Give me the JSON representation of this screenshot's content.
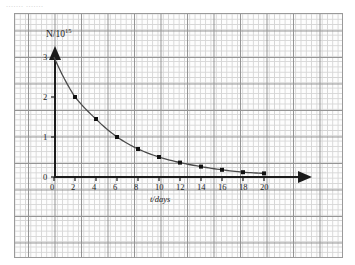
{
  "page": {
    "top_fragment": "....... ......."
  },
  "chart_data": {
    "type": "line",
    "title": "",
    "xlabel": "t/days",
    "ylabel": "N/10",
    "ylabel_exponent": "15",
    "xlim": [
      0,
      22
    ],
    "ylim": [
      0,
      3.2
    ],
    "xticks": [
      0,
      2,
      4,
      6,
      8,
      10,
      12,
      14,
      16,
      18,
      20
    ],
    "xtick_labels": [
      "0",
      "2",
      "4",
      "6",
      "8",
      "10",
      "12",
      "14",
      "16",
      "18",
      "20"
    ],
    "yticks": [
      0,
      1,
      2,
      3
    ],
    "ytick_labels": [
      "0",
      "1",
      "2",
      "3"
    ],
    "grid": true,
    "legend": false,
    "series": [
      {
        "name": "N",
        "x": [
          0,
          2,
          4,
          6,
          8,
          10,
          12,
          14,
          16,
          18,
          20
        ],
        "values": [
          3.0,
          2.0,
          1.45,
          1.0,
          0.7,
          0.5,
          0.36,
          0.26,
          0.18,
          0.12,
          0.09
        ],
        "marker": "filled-square",
        "marked_points_x": [
          2,
          4,
          6,
          8,
          10,
          12,
          14,
          16,
          18,
          20
        ],
        "color": "#4a4a4a"
      }
    ],
    "annotations": []
  }
}
